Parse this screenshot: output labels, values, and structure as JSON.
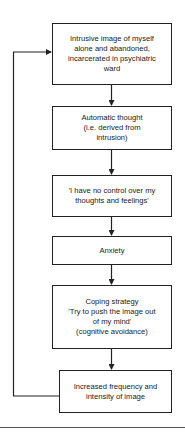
{
  "diagram": {
    "type": "flowchart",
    "direction": "top-to-bottom",
    "nodes": [
      {
        "id": "intrusive-image",
        "lines": [
          "Intrusive image of myself",
          "alone and abandoned,",
          "incarcerated in psychiatric",
          "ward"
        ]
      },
      {
        "id": "automatic-thought",
        "lines": [
          "Automatic thought",
          "(i.e. derived from",
          "intrusion)"
        ]
      },
      {
        "id": "no-control",
        "lines": [
          "'I have no control over my",
          "thoughts and feelings'"
        ]
      },
      {
        "id": "anxiety",
        "lines": [
          "Anxiety"
        ]
      },
      {
        "id": "coping-strategy",
        "lines": [
          "Coping strategy",
          "'Try to push the image out",
          "of my mind'",
          "(cognitive avoidance)"
        ]
      },
      {
        "id": "increased-frequency",
        "lines": [
          "Increased frequency and",
          "intensity of image"
        ]
      }
    ],
    "edges": [
      {
        "from": "intrusive-image",
        "to": "automatic-thought"
      },
      {
        "from": "automatic-thought",
        "to": "no-control"
      },
      {
        "from": "no-control",
        "to": "anxiety"
      },
      {
        "from": "anxiety",
        "to": "coping-strategy"
      },
      {
        "from": "coping-strategy",
        "to": "increased-frequency"
      },
      {
        "from": "increased-frequency",
        "to": "intrusive-image",
        "kind": "feedback-loop"
      }
    ],
    "colors": {
      "stroke": "#222222",
      "background": "#ffffff",
      "text": "#1a1a1a"
    }
  }
}
